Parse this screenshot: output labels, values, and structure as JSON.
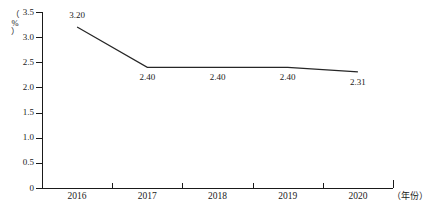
{
  "chart_data": {
    "type": "line",
    "title": "",
    "xlabel": "（年份）",
    "ylabel": "（%）",
    "categories": [
      "2016",
      "2017",
      "2018",
      "2019",
      "2020"
    ],
    "values": [
      3.2,
      2.4,
      2.4,
      2.4,
      2.31
    ],
    "point_labels": [
      "3.20",
      "2.40",
      "2.40",
      "2.40",
      "2.31"
    ],
    "ylim": [
      0,
      3.5
    ],
    "ytick_labels": [
      "0",
      "0.5",
      "1.0",
      "1.5",
      "2.0",
      "2.5",
      "3.0",
      "3.5"
    ],
    "ytick_values": [
      0,
      0.5,
      1.0,
      1.5,
      2.0,
      2.5,
      3.0,
      3.5
    ],
    "grid": false,
    "legend": null,
    "series": [
      {
        "name": "",
        "values": [
          3.2,
          2.4,
          2.4,
          2.4,
          2.31
        ],
        "color": "#262626"
      }
    ]
  },
  "axes": {
    "y_title_chars": [
      "（",
      "%",
      "）"
    ],
    "x_title": "（年份）"
  },
  "colors": {
    "line": "#262626",
    "axis": "#1a1a1a",
    "background": "#ffffff",
    "text": "#1a1a1a"
  }
}
